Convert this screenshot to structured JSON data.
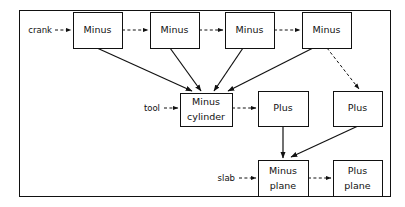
{
  "diagram": {
    "frame": {
      "x": 19,
      "y": 10,
      "width": 371,
      "height": 186
    },
    "colors": {
      "line": "#111111",
      "box_fill": "#ffffff",
      "background": "#ffffff"
    },
    "nodes": [
      {
        "id": "minus1",
        "name": "minus-box-1",
        "line1": "Minus",
        "line2": "",
        "x": 73,
        "y": 12,
        "w": 49,
        "h": 36
      },
      {
        "id": "minus2",
        "name": "minus-box-2",
        "line1": "Minus",
        "line2": "",
        "x": 150,
        "y": 12,
        "w": 49,
        "h": 36
      },
      {
        "id": "minus3",
        "name": "minus-box-3",
        "line1": "Minus",
        "line2": "",
        "x": 225,
        "y": 12,
        "w": 49,
        "h": 36
      },
      {
        "id": "minus4",
        "name": "minus-box-4",
        "line1": "Minus",
        "line2": "",
        "x": 302,
        "y": 12,
        "w": 49,
        "h": 36
      },
      {
        "id": "minuscyl",
        "name": "minus-cylinder-box",
        "line1": "Minus",
        "line2": "cylinder",
        "x": 180,
        "y": 93,
        "w": 52,
        "h": 33
      },
      {
        "id": "plus1",
        "name": "plus-box-center",
        "line1": "Plus",
        "line2": "",
        "x": 258,
        "y": 91,
        "w": 50,
        "h": 35
      },
      {
        "id": "plus2",
        "name": "plus-box-right",
        "line1": "Plus",
        "line2": "",
        "x": 333,
        "y": 91,
        "w": 49,
        "h": 35
      },
      {
        "id": "minusplane",
        "name": "minus-plane-box",
        "line1": "Minus",
        "line2": "plane",
        "x": 258,
        "y": 160,
        "w": 50,
        "h": 36
      },
      {
        "id": "plusplane",
        "name": "plus-plane-box",
        "line1": "Plus",
        "line2": "plane",
        "x": 333,
        "y": 160,
        "w": 49,
        "h": 36
      }
    ],
    "input_labels": [
      {
        "id": "crank",
        "name": "input-label-crank",
        "text": "crank",
        "x": 52,
        "y": 30
      },
      {
        "id": "tool",
        "name": "input-label-tool",
        "text": "tool",
        "x": 160,
        "y": 108
      },
      {
        "id": "slab",
        "name": "input-label-slab",
        "text": "slab",
        "x": 235,
        "y": 178
      }
    ],
    "edges": [
      {
        "id": "e-crank-minus1",
        "name": "edge-crank-to-minus1",
        "style": "dashed",
        "path": "M 55 30 L 71 30"
      },
      {
        "id": "e-minus1-minus2",
        "name": "edge-minus1-to-minus2",
        "style": "dashed",
        "path": "M 122 30 L 148 30"
      },
      {
        "id": "e-minus2-minus3",
        "name": "edge-minus2-to-minus3",
        "style": "dashed",
        "path": "M 199 30 L 223 30"
      },
      {
        "id": "e-minus3-minus4",
        "name": "edge-minus3-to-minus4",
        "style": "dashed",
        "path": "M 274 30 L 300 30"
      },
      {
        "id": "e-minus1-cyl",
        "name": "edge-minus1-to-minus-cylinder",
        "style": "solid",
        "path": "M 97 48 L 192 91"
      },
      {
        "id": "e-minus2-cyl",
        "name": "edge-minus2-to-minus-cylinder",
        "style": "solid",
        "path": "M 170 48 L 201 91"
      },
      {
        "id": "e-minus3-cyl",
        "name": "edge-minus3-to-minus-cylinder",
        "style": "solid",
        "path": "M 243 48 L 214 91"
      },
      {
        "id": "e-minus4-cyl",
        "name": "edge-minus4-to-minus-cylinder",
        "style": "solid",
        "path": "M 313 48 L 228 91"
      },
      {
        "id": "e-minus4-plus2",
        "name": "edge-minus4-to-plus-right",
        "style": "dashed",
        "path": "M 327 48 L 359 89"
      },
      {
        "id": "e-tool-cyl",
        "name": "edge-tool-to-minus-cylinder",
        "style": "dashed",
        "path": "M 164 108 L 178 108"
      },
      {
        "id": "e-cyl-plus1",
        "name": "edge-minus-cylinder-to-plus-center",
        "style": "dashed",
        "path": "M 232 108 L 256 108"
      },
      {
        "id": "e-plus1-minusplane",
        "name": "edge-plus-center-to-minus-plane",
        "style": "solid",
        "path": "M 283 126 L 283 158"
      },
      {
        "id": "e-plus2-minusplane",
        "name": "edge-plus-right-to-minus-plane",
        "style": "solid",
        "path": "M 358 126 L 291 157"
      },
      {
        "id": "e-slab-minusplane",
        "name": "edge-slab-to-minus-plane",
        "style": "dashed",
        "path": "M 239 178 L 256 178"
      },
      {
        "id": "e-minusplane-plusplane",
        "name": "edge-minus-plane-to-plus-plane",
        "style": "dashed",
        "path": "M 308 178 L 331 178"
      }
    ]
  }
}
